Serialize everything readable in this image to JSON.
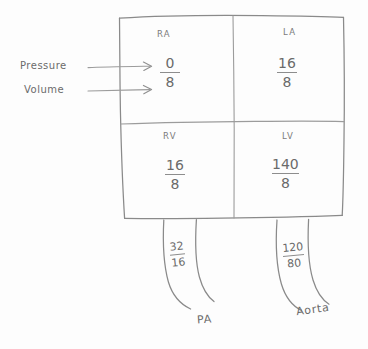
{
  "diagram": {
    "ink_color": "#8a8a8a",
    "background_color": "#fdfdfd",
    "side_labels": [
      {
        "text": "Pressure",
        "name": "pressure-label"
      },
      {
        "text": "Volume",
        "name": "volume-label"
      }
    ],
    "chambers": [
      {
        "id": "ra",
        "label": "RA",
        "pressure": "0",
        "volume": "8"
      },
      {
        "id": "la",
        "label": "LA",
        "pressure": "16",
        "volume": "8"
      },
      {
        "id": "rv",
        "label": "RV",
        "pressure": "16",
        "volume": "8"
      },
      {
        "id": "lv",
        "label": "LV",
        "pressure": "140",
        "volume": "8"
      }
    ],
    "vessels": [
      {
        "id": "pa",
        "label": "PA",
        "systolic": "32",
        "diastolic": "16"
      },
      {
        "id": "aorta",
        "label": "Aorta",
        "systolic": "120",
        "diastolic": "80"
      }
    ]
  }
}
